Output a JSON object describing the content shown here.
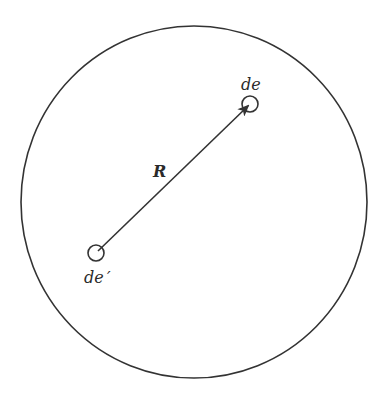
{
  "diagram": {
    "labels": {
      "charge_element": "de",
      "source_element": "de ′",
      "distance": "R"
    },
    "colors": {
      "stroke": "#333333",
      "text": "#2a2a2a",
      "background": "#ffffff"
    }
  }
}
